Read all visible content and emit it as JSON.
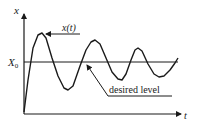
{
  "diagram": {
    "type": "damped-oscillation",
    "axes": {
      "y_label": "x",
      "x_label": "t",
      "level_label_main": "X",
      "level_label_sub": "0"
    },
    "annotations": {
      "curve_label": "x(t)",
      "level_label": "desired level"
    },
    "colors": {
      "stroke": "#1a1a1a",
      "background": "#ffffff"
    },
    "curve_points": [
      [
        24,
        112
      ],
      [
        28,
        80
      ],
      [
        33,
        48
      ],
      [
        38,
        35
      ],
      [
        42,
        33
      ],
      [
        46,
        38
      ],
      [
        52,
        58
      ],
      [
        58,
        76
      ],
      [
        64,
        88
      ],
      [
        68,
        90
      ],
      [
        73,
        86
      ],
      [
        80,
        66
      ],
      [
        86,
        50
      ],
      [
        91,
        42
      ],
      [
        95,
        40
      ],
      [
        100,
        44
      ],
      [
        106,
        58
      ],
      [
        112,
        72
      ],
      [
        118,
        79
      ],
      [
        122,
        80
      ],
      [
        126,
        74
      ],
      [
        131,
        60
      ],
      [
        135,
        50
      ],
      [
        138,
        48
      ],
      [
        142,
        51
      ],
      [
        148,
        64
      ],
      [
        154,
        74
      ],
      [
        159,
        77
      ],
      [
        164,
        76
      ],
      [
        170,
        70
      ],
      [
        175,
        63
      ],
      [
        178,
        58
      ]
    ]
  }
}
